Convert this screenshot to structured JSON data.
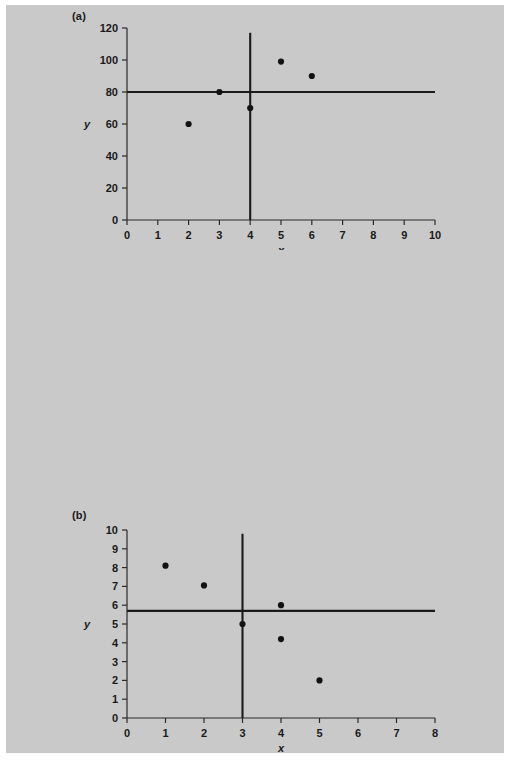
{
  "figure": {
    "background_color": "#c9c9c9",
    "ink_color": "#1a1a1a",
    "point_color": "#121212"
  },
  "panels": [
    {
      "key": "a",
      "label": "(a)",
      "xlabel": "x",
      "ylabel": "y"
    },
    {
      "key": "b",
      "label": "(b)",
      "xlabel": "x",
      "ylabel": "y"
    },
    {
      "key": "c",
      "label": "(c)",
      "xlabel": "x",
      "ylabel": "y"
    }
  ],
  "chart_data": [
    {
      "type": "scatter",
      "panel": "(a)",
      "title": "",
      "xlabel": "x",
      "ylabel": "y",
      "xlim": [
        0,
        10
      ],
      "ylim": [
        0,
        120
      ],
      "xticks": [
        0,
        1,
        2,
        3,
        4,
        5,
        6,
        7,
        8,
        9,
        10
      ],
      "xticklabels": [
        "0",
        "1",
        "2",
        "3",
        "4",
        "5",
        "6",
        "7",
        "8",
        "9",
        "10"
      ],
      "yticks": [
        0,
        20,
        40,
        60,
        80,
        100,
        120
      ],
      "yticklabels": [
        "0",
        "20",
        "40",
        "60",
        "80",
        "100",
        "120"
      ],
      "grid": false,
      "legend": "none",
      "points": [
        {
          "x": 2,
          "y": 60
        },
        {
          "x": 3,
          "y": 80
        },
        {
          "x": 4,
          "y": 70
        },
        {
          "x": 5,
          "y": 99
        },
        {
          "x": 6,
          "y": 90
        }
      ],
      "reference_lines": [
        {
          "orientation": "horizontal",
          "value": 80,
          "label": "mean y"
        },
        {
          "orientation": "vertical",
          "value": 4,
          "label": "mean x",
          "extent": [
            0,
            117
          ]
        }
      ]
    },
    {
      "type": "scatter",
      "panel": "(b)",
      "title": "",
      "xlabel": "x",
      "ylabel": "y",
      "xlim": [
        0,
        8
      ],
      "ylim": [
        0,
        10
      ],
      "xticks": [
        0,
        1,
        2,
        3,
        4,
        5,
        6,
        7,
        8
      ],
      "xticklabels": [
        "0",
        "1",
        "2",
        "3",
        "4",
        "5",
        "6",
        "7",
        "8"
      ],
      "yticks": [
        0,
        1,
        2,
        3,
        4,
        5,
        6,
        7,
        8,
        9,
        10
      ],
      "yticklabels": [
        "0",
        "1",
        "2",
        "3",
        "4",
        "5",
        "6",
        "7",
        "8",
        "9",
        "10"
      ],
      "grid": false,
      "legend": "none",
      "points": [
        {
          "x": 1,
          "y": 8.1
        },
        {
          "x": 2,
          "y": 7.05
        },
        {
          "x": 3,
          "y": 5.0
        },
        {
          "x": 4,
          "y": 6.0
        },
        {
          "x": 4,
          "y": 4.2
        },
        {
          "x": 5,
          "y": 2.0
        }
      ],
      "reference_lines": [
        {
          "orientation": "horizontal",
          "value": 5.7,
          "label": "mean y"
        },
        {
          "orientation": "vertical",
          "value": 3,
          "label": "mean x",
          "extent": [
            0,
            9.8
          ]
        }
      ]
    },
    {
      "type": "scatter",
      "panel": "(c)",
      "title": "",
      "xlabel": "x",
      "ylabel": "y",
      "xlim": [
        0,
        12
      ],
      "ylim": [
        0,
        12
      ],
      "xticks": [
        0,
        2,
        4,
        6,
        8,
        10,
        12
      ],
      "xticklabels": [
        "0",
        "2",
        "4",
        "6",
        "8",
        "10",
        "12"
      ],
      "yticks": [
        0,
        2,
        4,
        6,
        8,
        10,
        12
      ],
      "yticklabels": [
        "0",
        "2",
        "4",
        "6",
        "8",
        "10",
        "12"
      ],
      "grid": false,
      "legend": "none",
      "points": [
        {
          "x": 2,
          "y": 4.1
        },
        {
          "x": 3,
          "y": 2.0
        },
        {
          "x": 4,
          "y": 8.0
        },
        {
          "x": 5,
          "y": 1.0
        },
        {
          "x": 6,
          "y": 7.0
        },
        {
          "x": 6,
          "y": 4.1
        },
        {
          "x": 7,
          "y": 9.0
        },
        {
          "x": 8.1,
          "y": 3.0
        }
      ],
      "reference_lines": [
        {
          "orientation": "horizontal",
          "value": 5,
          "label": "mean y"
        },
        {
          "orientation": "vertical",
          "value": 5,
          "label": "mean x",
          "extent": [
            0,
            11.7
          ]
        }
      ]
    }
  ]
}
